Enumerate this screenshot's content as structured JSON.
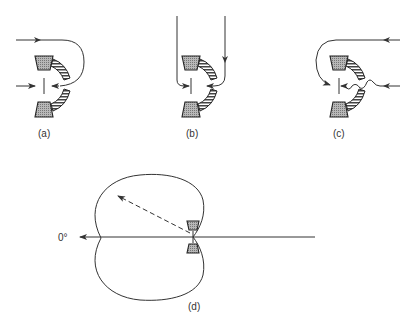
{
  "figure": {
    "panels": [
      {
        "id": "a",
        "label": "(a)",
        "description": "Microphone with front and rear sound paths arriving at diaphragm"
      },
      {
        "id": "b",
        "label": "(b)",
        "description": "Sound arriving from above along both paths"
      },
      {
        "id": "c",
        "label": "(c)",
        "description": "Sound from rear with delay network (wavy path)"
      },
      {
        "id": "d",
        "label": "(d)",
        "description": "Cardioid polar pattern"
      }
    ],
    "polar": {
      "angle_label": "0°",
      "pattern": "cardioid"
    }
  }
}
